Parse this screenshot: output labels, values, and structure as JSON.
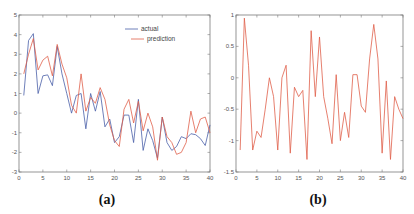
{
  "chart_data": [
    {
      "type": "line",
      "caption": "(a)",
      "title": "",
      "xlabel": "",
      "ylabel": "",
      "xlim": [
        0,
        40
      ],
      "ylim": [
        -3,
        5
      ],
      "xticks": [
        0,
        5,
        10,
        15,
        20,
        25,
        30,
        35,
        40
      ],
      "yticks": [
        -3,
        -2,
        -1,
        0,
        1,
        2,
        3,
        4,
        5
      ],
      "grid": false,
      "legend": {
        "position": "top-right",
        "entries": [
          "actual",
          "prediction"
        ]
      },
      "x": [
        1,
        2,
        3,
        4,
        5,
        6,
        7,
        8,
        9,
        10,
        11,
        12,
        13,
        14,
        15,
        16,
        17,
        18,
        19,
        20,
        21,
        22,
        23,
        24,
        25,
        26,
        27,
        28,
        29,
        30,
        31,
        32,
        33,
        34,
        35,
        36,
        37,
        38,
        39,
        40
      ],
      "series": [
        {
          "name": "actual",
          "color": "#4a5fa8",
          "values": [
            0.9,
            3.7,
            4.05,
            1.0,
            1.9,
            1.95,
            1.4,
            3.4,
            2.0,
            1.0,
            0.0,
            0.9,
            1.0,
            -0.8,
            1.0,
            0.1,
            1.1,
            -0.7,
            -0.3,
            -1.5,
            -1.2,
            -0.1,
            -0.1,
            -1.5,
            0.7,
            -1.9,
            -0.8,
            -1.4,
            -2.3,
            -0.2,
            -1.5,
            -1.9,
            -1.7,
            -1.2,
            -1.3,
            -1.05,
            -1.1,
            -1.3,
            -1.65,
            -0.6
          ]
        },
        {
          "name": "prediction",
          "color": "#e0604a",
          "values": [
            2.0,
            3.0,
            3.8,
            2.2,
            2.7,
            2.9,
            1.9,
            3.5,
            2.5,
            1.8,
            0.4,
            0.0,
            2.0,
            0.1,
            0.8,
            0.5,
            1.3,
            0.7,
            -0.6,
            -1.4,
            -1.7,
            0.2,
            0.7,
            -0.5,
            0.6,
            -0.9,
            0.0,
            -0.7,
            -2.4,
            -0.2,
            -1.2,
            -1.5,
            -2.1,
            -2.0,
            -1.5,
            0.1,
            -1.0,
            -0.3,
            -0.2,
            -1.0
          ]
        }
      ]
    },
    {
      "type": "line",
      "caption": "(b)",
      "title": "",
      "xlabel": "",
      "ylabel": "",
      "xlim": [
        0,
        40
      ],
      "ylim": [
        -1.5,
        1
      ],
      "xticks": [
        0,
        5,
        10,
        15,
        20,
        25,
        30,
        35,
        40
      ],
      "yticks": [
        -1.5,
        -1,
        -0.5,
        0,
        0.5,
        1
      ],
      "ytick_labels": [
        "-1.5",
        "-1",
        "-0.5",
        "0",
        "0.5",
        "1"
      ],
      "grid": false,
      "legend": null,
      "x": [
        1,
        2,
        3,
        4,
        5,
        6,
        7,
        8,
        9,
        10,
        11,
        12,
        13,
        14,
        15,
        16,
        17,
        18,
        19,
        20,
        21,
        22,
        23,
        24,
        25,
        26,
        27,
        28,
        29,
        30,
        31,
        32,
        33,
        34,
        35,
        36,
        37,
        38,
        39,
        40
      ],
      "series": [
        {
          "name": "error",
          "color": "#e0604a",
          "values": [
            -1.15,
            0.95,
            0.2,
            -1.15,
            -0.85,
            -0.95,
            -0.5,
            0.0,
            -0.3,
            -1.15,
            0.0,
            0.2,
            -1.2,
            -0.15,
            -0.3,
            -0.2,
            -1.3,
            0.75,
            -0.3,
            0.65,
            -0.3,
            -0.65,
            -1.05,
            0.05,
            -1.0,
            -0.55,
            -0.95,
            0.05,
            0.05,
            -0.45,
            -0.55,
            0.3,
            0.85,
            0.3,
            -1.2,
            -0.05,
            -1.3,
            -0.3,
            -0.5,
            -0.65
          ]
        }
      ]
    }
  ]
}
